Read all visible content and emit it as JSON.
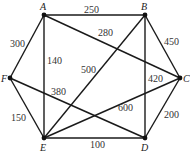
{
  "graph": {
    "nodes": [
      {
        "id": "A",
        "x": 44,
        "y": 15,
        "lx": 40,
        "ly": 10
      },
      {
        "id": "B",
        "x": 145,
        "y": 15,
        "lx": 141,
        "ly": 10
      },
      {
        "id": "C",
        "x": 180,
        "y": 78,
        "lx": 183,
        "ly": 82
      },
      {
        "id": "D",
        "x": 145,
        "y": 138,
        "lx": 141,
        "ly": 151
      },
      {
        "id": "E",
        "x": 44,
        "y": 138,
        "lx": 40,
        "ly": 151
      },
      {
        "id": "F",
        "x": 10,
        "y": 78,
        "lx": 1,
        "ly": 82
      }
    ],
    "edges": [
      {
        "from": "A",
        "to": "B",
        "weight": "250",
        "lx": 84,
        "ly": 13
      },
      {
        "from": "A",
        "to": "C",
        "weight": "280",
        "lx": 98,
        "ly": 36
      },
      {
        "from": "A",
        "to": "F",
        "weight": "300",
        "lx": 10,
        "ly": 47
      },
      {
        "from": "A",
        "to": "E",
        "weight": "140",
        "lx": 47,
        "ly": 64
      },
      {
        "from": "B",
        "to": "C",
        "weight": "450",
        "lx": 164,
        "ly": 45
      },
      {
        "from": "B",
        "to": "D",
        "weight": "420",
        "lx": 148,
        "ly": 82
      },
      {
        "from": "B",
        "to": "E",
        "weight": "500",
        "lx": 81,
        "ly": 73
      },
      {
        "from": "C",
        "to": "D",
        "weight": "200",
        "lx": 164,
        "ly": 118
      },
      {
        "from": "C",
        "to": "E",
        "weight": "600",
        "lx": 118,
        "ly": 111
      },
      {
        "from": "E",
        "to": "D",
        "weight": "100",
        "lx": 90,
        "ly": 148
      },
      {
        "from": "E",
        "to": "F",
        "weight": "150",
        "lx": 11,
        "ly": 121
      },
      {
        "from": "F",
        "to": "D",
        "weight": "380",
        "lx": 51,
        "ly": 95
      }
    ]
  }
}
